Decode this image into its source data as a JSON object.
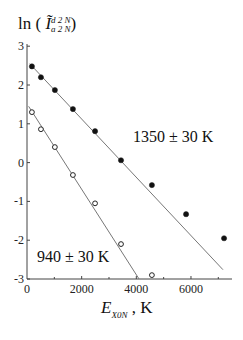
{
  "chart_data": {
    "type": "scatter",
    "title": "",
    "ylabel": "ln ( Ĩ d2N / a2N )",
    "ylabel_parts": {
      "prefix": "ln (",
      "symbol": "Ĩ",
      "superscript": "d 2 N",
      "subscript": "a 2 N",
      "suffix": ")"
    },
    "xlabel": "E_X0N , K",
    "xlabel_parts": {
      "symbol": "E",
      "subscript": "X0N",
      "suffix": ", K"
    },
    "xlim": [
      0,
      7500
    ],
    "ylim": [
      -3,
      3
    ],
    "xticks": [
      0,
      2000,
      4000,
      6000
    ],
    "yticks": [
      3,
      2,
      1,
      0,
      -1,
      -2,
      -3
    ],
    "grid": false,
    "series": [
      {
        "name": "1350 ± 30 K",
        "marker": "filled-circle",
        "x": [
          180,
          510,
          1020,
          1680,
          2490,
          3440,
          4570,
          5820,
          7210
        ],
        "y": [
          2.48,
          2.2,
          1.87,
          1.38,
          0.81,
          0.06,
          -0.58,
          -1.33,
          -1.95
        ],
        "fit_line": {
          "x": [
            100,
            7170
          ],
          "y": [
            2.55,
            -2.76
          ]
        }
      },
      {
        "name": "940 ± 30 K",
        "marker": "open-circle",
        "x": [
          180,
          510,
          1020,
          1680,
          2490,
          3440,
          4570
        ],
        "y": [
          1.3,
          0.86,
          0.4,
          -0.32,
          -1.05,
          -2.1,
          -2.9
        ],
        "fit_line": {
          "x": [
            60,
            4100
          ],
          "y": [
            1.45,
            -3.0
          ]
        }
      }
    ],
    "annotations": [
      {
        "text": "1350 ± 30 K",
        "series": "filled"
      },
      {
        "text": "940 ± 30 K",
        "series": "open"
      }
    ]
  }
}
